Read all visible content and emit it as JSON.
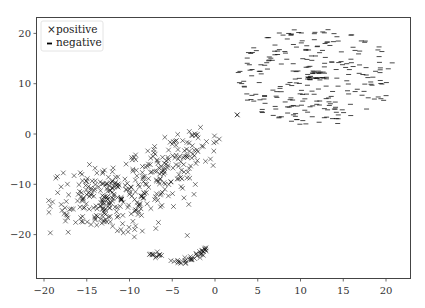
{
  "chart_data": {
    "type": "scatter",
    "title": "",
    "xlabel": "",
    "ylabel": "",
    "xlim": [
      -21,
      23
    ],
    "ylim": [
      -28,
      23
    ],
    "xticks": [
      -20,
      -15,
      -10,
      -5,
      0,
      5,
      10,
      15,
      20
    ],
    "xtick_labels": [
      "−20",
      "−15",
      "−10",
      "−5",
      "0",
      "5",
      "10",
      "15",
      "20"
    ],
    "yticks": [
      20,
      10,
      0,
      -10,
      -20
    ],
    "ytick_labels": [
      "20",
      "10",
      "0",
      "−10",
      "−20"
    ],
    "grid": false,
    "legend_position": "upper left",
    "legend": [
      {
        "label": "positive",
        "marker": "x"
      },
      {
        "label": "negative",
        "marker": "_"
      }
    ],
    "series": [
      {
        "name": "positive",
        "marker": "x",
        "color": "#000000",
        "description": "Large irregular cluster in lower-left region plus a tail arc near bottom and one outlier",
        "clusters": [
          {
            "cx": -12.5,
            "cy": -13.0,
            "sx": 3.4,
            "sy": 3.6,
            "n": 230
          },
          {
            "cx": -6.0,
            "cy": -8.0,
            "sx": 2.4,
            "sy": 2.6,
            "n": 90
          },
          {
            "cx": -3.0,
            "cy": -2.5,
            "sx": 2.2,
            "sy": 1.6,
            "n": 45
          }
        ],
        "arc": {
          "x_from": -7.6,
          "x_to": -1.0,
          "n": 45,
          "points": [
            [
              -7.6,
              -24.0
            ],
            [
              -6.5,
              -24.2
            ],
            [
              -5.0,
              -25.0
            ],
            [
              -4.0,
              -25.7
            ],
            [
              -3.0,
              -25.0
            ],
            [
              -2.0,
              -24.5
            ],
            [
              -1.2,
              -23.0
            ]
          ]
        },
        "outliers": [
          [
            2.6,
            3.8
          ],
          [
            -8.5,
            -19.3
          ],
          [
            -7.5,
            -14.8
          ]
        ],
        "sample_points": [
          [
            -19.0,
            -13.5
          ],
          [
            -18.0,
            -10.5
          ],
          [
            -17.0,
            -15.0
          ],
          [
            -16.0,
            -12.0
          ],
          [
            -15.0,
            -9.5
          ],
          [
            -14.5,
            -18.0
          ],
          [
            -13.0,
            -14.0
          ],
          [
            -12.0,
            -7.5
          ],
          [
            -11.0,
            -19.0
          ],
          [
            -10.0,
            -12.0
          ],
          [
            -9.0,
            -16.0
          ],
          [
            -8.0,
            -10.0
          ],
          [
            -7.0,
            -4.0
          ],
          [
            -6.0,
            -8.0
          ],
          [
            -5.0,
            -2.0
          ],
          [
            -4.0,
            -5.5
          ],
          [
            -3.0,
            0.5
          ],
          [
            -2.0,
            -3.5
          ],
          [
            -1.0,
            -1.5
          ],
          [
            0.5,
            -1.0
          ],
          [
            -6.5,
            -24.0
          ],
          [
            -4.0,
            -25.7
          ],
          [
            -1.2,
            -23.0
          ],
          [
            2.6,
            3.8
          ]
        ]
      },
      {
        "name": "negative",
        "marker": "_",
        "color": "#000000",
        "description": "Roughly circular ring-like cloud centered near (11.5, 11.5) with dense core",
        "clusters": [
          {
            "cx": 11.8,
            "cy": 11.5,
            "radius": 9.8,
            "n": 260,
            "shape": "disk"
          },
          {
            "cx": 11.8,
            "cy": 11.6,
            "radius": 1.0,
            "n": 30,
            "shape": "core"
          }
        ],
        "sample_points": [
          [
            3.5,
            12.0
          ],
          [
            5.0,
            16.0
          ],
          [
            7.0,
            19.0
          ],
          [
            10.0,
            20.5
          ],
          [
            13.0,
            20.5
          ],
          [
            16.0,
            19.0
          ],
          [
            18.5,
            16.5
          ],
          [
            20.5,
            12.0
          ],
          [
            20.0,
            8.0
          ],
          [
            18.0,
            5.0
          ],
          [
            15.0,
            2.5
          ],
          [
            12.0,
            1.5
          ],
          [
            9.0,
            2.5
          ],
          [
            6.0,
            4.5
          ],
          [
            4.5,
            8.0
          ],
          [
            11.8,
            11.6
          ],
          [
            12.2,
            11.4
          ],
          [
            11.4,
            11.8
          ],
          [
            14.0,
            9.0
          ],
          [
            9.0,
            14.0
          ]
        ]
      }
    ]
  },
  "colors": {
    "axis": "#444444",
    "marker": "#000000",
    "background": "#ffffff"
  }
}
